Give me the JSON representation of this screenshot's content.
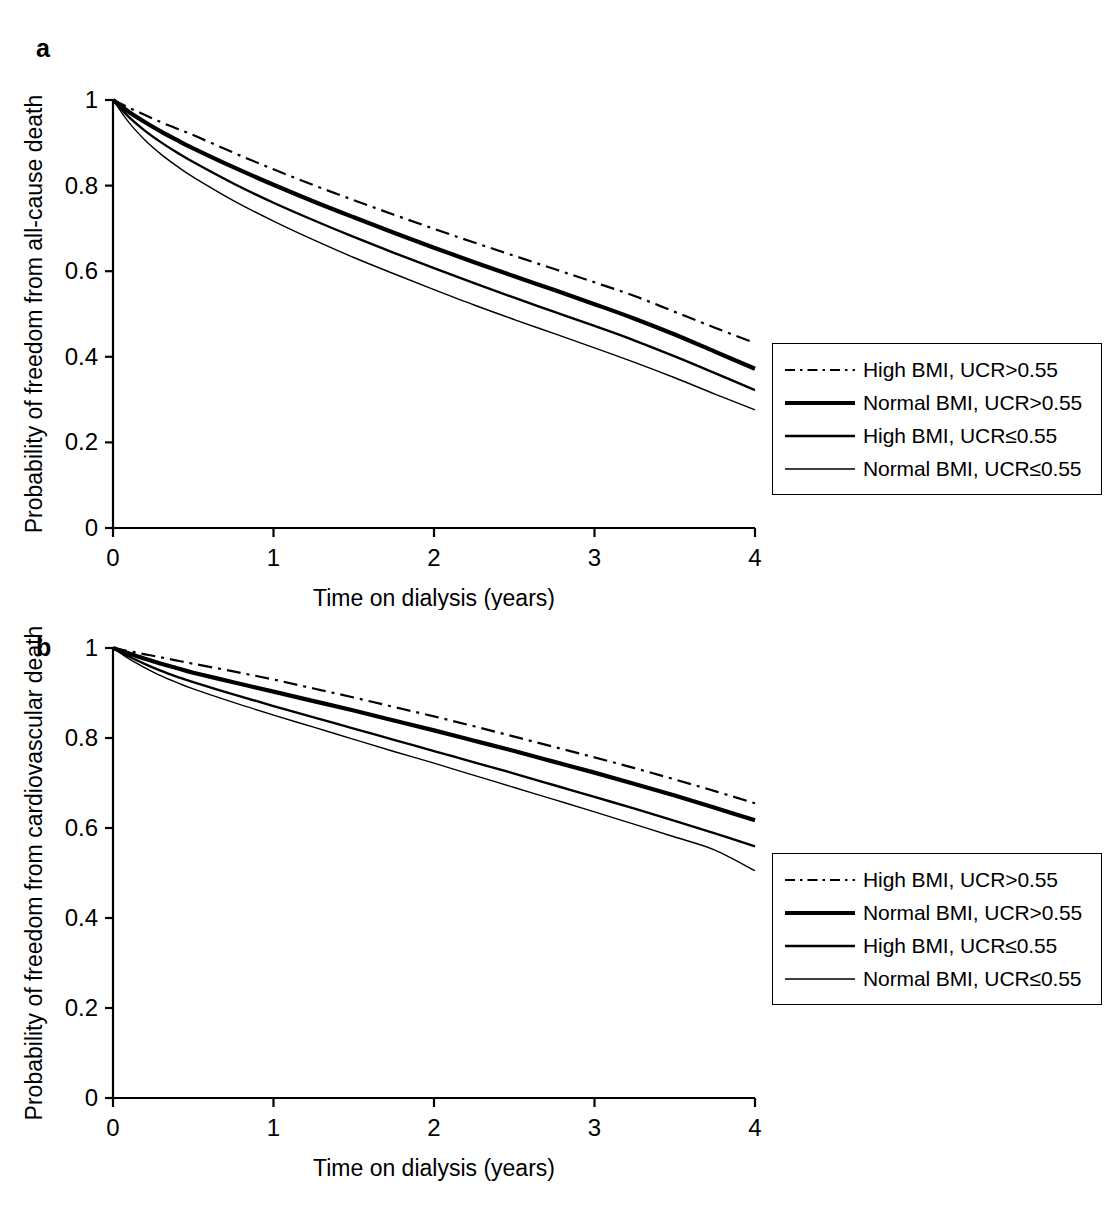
{
  "figure": {
    "panels": [
      {
        "letter": "a",
        "ylabel": "Probability of freedom from all-cause death",
        "xlabel": "Time on dialysis (years)"
      },
      {
        "letter": "b",
        "ylabel": "Probability of freedom from cardiovascular death",
        "xlabel": "Time on dialysis (years)"
      }
    ],
    "legend_labels": [
      "High BMI, UCR>0.55",
      "Normal BMI, UCR>0.55",
      "High BMI, UCR≤0.55",
      "Normal BMI, UCR≤0.55"
    ],
    "colors": {
      "line": "#000000",
      "axis": "#000000",
      "background": "#ffffff"
    }
  },
  "chart_data": [
    {
      "type": "line",
      "panel": "a",
      "title": "",
      "xlabel": "Time on dialysis (years)",
      "ylabel": "Probability of freedom from all-cause death",
      "xlim": [
        0,
        4
      ],
      "ylim": [
        0,
        1
      ],
      "xticks": [
        0,
        1,
        2,
        3,
        4
      ],
      "xticklabels": [
        "0",
        "1",
        "2",
        "3",
        "4"
      ],
      "yticks": [
        0,
        0.2,
        0.4,
        0.6,
        0.8,
        1
      ],
      "yticklabels": [
        "0",
        "0.2",
        "0.4",
        "0.6",
        "0.8",
        "1"
      ],
      "grid": false,
      "legend_position": "right",
      "x": [
        0,
        0.1,
        0.2,
        0.3,
        0.4,
        0.5,
        0.75,
        1,
        1.25,
        1.5,
        1.75,
        2,
        2.25,
        2.5,
        2.75,
        3,
        3.25,
        3.5,
        3.75,
        4
      ],
      "series": [
        {
          "name": "High BMI, UCR>0.55",
          "style": "dash-dot",
          "width": 2.2,
          "values": [
            1,
            0.982,
            0.965,
            0.948,
            0.933,
            0.918,
            0.877,
            0.838,
            0.801,
            0.766,
            0.732,
            0.699,
            0.667,
            0.636,
            0.605,
            0.574,
            0.542,
            0.505,
            0.468,
            0.432
          ]
        },
        {
          "name": "Normal BMI, UCR>0.55",
          "style": "solid",
          "width": 4.2,
          "values": [
            1,
            0.972,
            0.948,
            0.926,
            0.906,
            0.887,
            0.843,
            0.802,
            0.763,
            0.726,
            0.69,
            0.655,
            0.621,
            0.588,
            0.556,
            0.523,
            0.489,
            0.452,
            0.412,
            0.372
          ]
        },
        {
          "name": "High BMI, UCR≤0.55",
          "style": "solid",
          "width": 2.4,
          "values": [
            1,
            0.96,
            0.928,
            0.901,
            0.877,
            0.855,
            0.805,
            0.76,
            0.719,
            0.68,
            0.643,
            0.607,
            0.572,
            0.538,
            0.505,
            0.472,
            0.438,
            0.401,
            0.362,
            0.322
          ]
        },
        {
          "name": "Normal BMI, UCR≤0.55",
          "style": "solid",
          "width": 1.4,
          "values": [
            1,
            0.947,
            0.906,
            0.873,
            0.845,
            0.82,
            0.765,
            0.717,
            0.673,
            0.632,
            0.594,
            0.557,
            0.521,
            0.487,
            0.454,
            0.421,
            0.387,
            0.351,
            0.313,
            0.276
          ]
        }
      ],
      "endpoint_values_at_4_years": [
        0.432,
        0.372,
        0.322,
        0.276
      ]
    },
    {
      "type": "line",
      "panel": "b",
      "title": "",
      "xlabel": "Time on dialysis (years)",
      "ylabel": "Probability of freedom from cardiovascular death",
      "xlim": [
        0,
        4
      ],
      "ylim": [
        0,
        1
      ],
      "xticks": [
        0,
        1,
        2,
        3,
        4
      ],
      "xticklabels": [
        "0",
        "1",
        "2",
        "3",
        "4"
      ],
      "yticks": [
        0,
        0.2,
        0.4,
        0.6,
        0.8,
        1
      ],
      "yticklabels": [
        "0",
        "0.2",
        "0.4",
        "0.6",
        "0.8",
        "1"
      ],
      "grid": false,
      "legend_position": "right",
      "x": [
        0,
        0.1,
        0.2,
        0.3,
        0.4,
        0.5,
        0.75,
        1,
        1.25,
        1.5,
        1.75,
        2,
        2.25,
        2.5,
        2.75,
        3,
        3.25,
        3.5,
        3.75,
        4
      ],
      "series": [
        {
          "name": "High BMI, UCR>0.55",
          "style": "dash-dot",
          "width": 2.2,
          "values": [
            1,
            0.993,
            0.986,
            0.979,
            0.972,
            0.965,
            0.948,
            0.93,
            0.91,
            0.89,
            0.869,
            0.848,
            0.826,
            0.803,
            0.78,
            0.757,
            0.733,
            0.708,
            0.682,
            0.655
          ]
        },
        {
          "name": "Normal BMI, UCR>0.55",
          "style": "solid",
          "width": 4.2,
          "values": [
            1,
            0.988,
            0.976,
            0.965,
            0.955,
            0.945,
            0.924,
            0.903,
            0.882,
            0.861,
            0.839,
            0.817,
            0.794,
            0.771,
            0.747,
            0.723,
            0.698,
            0.672,
            0.645,
            0.617
          ]
        },
        {
          "name": "High BMI, UCR≤0.55",
          "style": "solid",
          "width": 2.4,
          "values": [
            1,
            0.981,
            0.964,
            0.949,
            0.936,
            0.924,
            0.897,
            0.871,
            0.846,
            0.821,
            0.796,
            0.771,
            0.746,
            0.721,
            0.695,
            0.669,
            0.643,
            0.616,
            0.588,
            0.559
          ]
        },
        {
          "name": "Normal BMI, UCR≤0.55",
          "style": "solid",
          "width": 1.4,
          "values": [
            1,
            0.976,
            0.956,
            0.938,
            0.923,
            0.909,
            0.879,
            0.851,
            0.824,
            0.797,
            0.77,
            0.744,
            0.717,
            0.69,
            0.663,
            0.636,
            0.608,
            0.58,
            0.551,
            0.505
          ]
        }
      ],
      "endpoint_values_at_4_years": [
        0.655,
        0.617,
        0.559,
        0.505
      ]
    }
  ]
}
